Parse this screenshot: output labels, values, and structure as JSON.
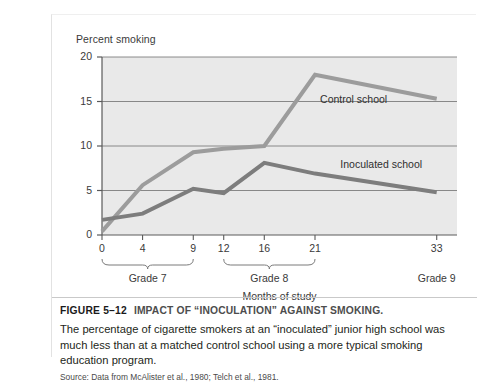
{
  "figure": {
    "number_label": "FIGURE 5–12",
    "title": "IMPACT OF “INOCULATION” AGAINST SMOKING.",
    "body": "The percentage of cigarette smokers at an “inoculated” junior high school was much less than at a matched control school using a more typical smoking education program.",
    "source": "Source: Data from McAlister et al., 1980; Telch et al., 1981."
  },
  "colors": {
    "control_line": "#9c9c9c",
    "inoculated_line": "#7d7d7d",
    "plot_background": "#e9e9e9",
    "gridline": "#6f6f6f",
    "axis": "#5a5a5a",
    "text": "#3a3a3a"
  },
  "chart_data": {
    "type": "line",
    "title": "Percent smoking",
    "xlabel": "Months of study",
    "ylabel": "Percent smoking",
    "x": [
      0,
      4,
      9,
      12,
      16,
      21,
      33
    ],
    "xtick_labels": [
      "0",
      "4",
      "9",
      "12",
      "16",
      "21",
      "33"
    ],
    "ytick_labels": [
      "0",
      "5",
      "10",
      "15",
      "20"
    ],
    "yticks": [
      0,
      5,
      10,
      15,
      20
    ],
    "ylim": [
      0,
      20
    ],
    "xlim": [
      0,
      35
    ],
    "grid": true,
    "legend_position": "inline-annotations",
    "series": [
      {
        "name": "Control school",
        "values": [
          0.4,
          5.6,
          9.3,
          9.7,
          10.0,
          18.0,
          15.3
        ]
      },
      {
        "name": "Inoculated school",
        "values": [
          1.7,
          2.4,
          5.2,
          4.7,
          8.1,
          6.9,
          4.8
        ]
      }
    ],
    "annotations": [
      {
        "text": "Control school",
        "x": 21.5,
        "y": 15.2
      },
      {
        "text": "Inoculated school",
        "x": 23.5,
        "y": 7.9
      }
    ],
    "grade_groups": [
      {
        "label": "Grade 7",
        "from": 0,
        "to": 9,
        "bracket": true
      },
      {
        "label": "Grade 8",
        "from": 12,
        "to": 21,
        "bracket": true
      },
      {
        "label": "Grade 9",
        "from": 33,
        "to": 33,
        "bracket": false
      }
    ]
  }
}
